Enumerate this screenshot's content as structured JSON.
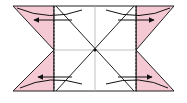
{
  "diagram": {
    "type": "origami-fold-instruction",
    "colors": {
      "background": "#ffffff",
      "flap_fill": "#f5c9d4",
      "outline": "#222222",
      "crease": "#aaaaaa",
      "arrow": "#111111"
    },
    "square": {
      "left": 54,
      "right": 136,
      "top": 6,
      "bottom": 91,
      "center": [
        95,
        50
      ]
    },
    "flaps": [
      {
        "id": "top-left",
        "points": "13,6 54,6 54,50"
      },
      {
        "id": "bottom-left",
        "points": "54,50 54,91 13,91"
      },
      {
        "id": "top-right",
        "points": "136,6 174,6 136,50"
      },
      {
        "id": "bottom-right",
        "points": "136,50 174,91 136,91"
      }
    ],
    "arrows": [
      {
        "id": "top-left",
        "direction": "left"
      },
      {
        "id": "bottom-left",
        "direction": "left"
      },
      {
        "id": "top-right",
        "direction": "right"
      },
      {
        "id": "bottom-right",
        "direction": "right"
      }
    ]
  }
}
